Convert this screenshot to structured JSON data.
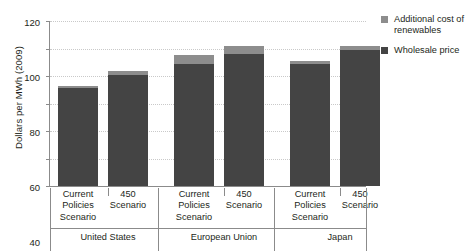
{
  "chart_data": {
    "type": "bar",
    "subtype": "stacked-bar-grouped",
    "title": "",
    "subtitle": "",
    "xlabel": "",
    "ylabel": "Dollars per MWh (2009)",
    "ylim": [
      0,
      120
    ],
    "yticks": [
      0,
      20,
      40,
      60,
      80,
      100,
      120
    ],
    "ytick_labels": [
      "0",
      "20",
      "40",
      "60",
      "80",
      "100",
      "120"
    ],
    "grid": "horizontal-dotted",
    "legend_position": "right-top",
    "groups": [
      "United States",
      "European Union",
      "Japan"
    ],
    "categories": [
      "Current Policies Scenario",
      "450 Scenario",
      "Current Policies Scenario",
      "450 Scenario",
      "Current Policies Scenario",
      "450 Scenario"
    ],
    "series": [
      {
        "name": "Wholesale price",
        "color": "#444444",
        "values": [
          71,
          81,
          89,
          96,
          89,
          99
        ]
      },
      {
        "name": "Additional cost of renewables",
        "color": "#8d8d8d",
        "values": [
          2,
          3,
          6,
          6,
          2,
          3
        ]
      }
    ],
    "totals": [
      73,
      84,
      95,
      102,
      91,
      102
    ]
  },
  "axis": {
    "y_title": "Dollars per MWh (2009)",
    "y_ticks": [
      {
        "value": 120,
        "label": "120"
      },
      {
        "value": 100,
        "label": "100"
      },
      {
        "value": 80,
        "label": "80"
      },
      {
        "value": 60,
        "label": "60"
      },
      {
        "value": 40,
        "label": "40"
      },
      {
        "value": 20,
        "label": "20"
      },
      {
        "value": 0,
        "label": "0"
      }
    ]
  },
  "bars": [
    {
      "id": "us-cps",
      "scenario_line1": "Current",
      "scenario_line2": "Policies",
      "scenario_line3": "Scenario",
      "wholesale": 71,
      "renewables": 2
    },
    {
      "id": "us-450",
      "scenario_line1": "450",
      "scenario_line2": "Scenario",
      "scenario_line3": "",
      "wholesale": 81,
      "renewables": 3
    },
    {
      "id": "eu-cps",
      "scenario_line1": "Current",
      "scenario_line2": "Policies",
      "scenario_line3": "Scenario",
      "wholesale": 89,
      "renewables": 6
    },
    {
      "id": "eu-450",
      "scenario_line1": "450",
      "scenario_line2": "Scenario",
      "scenario_line3": "",
      "wholesale": 96,
      "renewables": 6
    },
    {
      "id": "jp-cps",
      "scenario_line1": "Current",
      "scenario_line2": "Policies",
      "scenario_line3": "Scenario",
      "wholesale": 89,
      "renewables": 2
    },
    {
      "id": "jp-450",
      "scenario_line1": "450",
      "scenario_line2": "Scenario",
      "scenario_line3": "",
      "wholesale": 99,
      "renewables": 3
    }
  ],
  "groups": [
    {
      "id": "united-states",
      "label": "United States"
    },
    {
      "id": "european-union",
      "label": "European Union"
    },
    {
      "id": "japan",
      "label": "Japan"
    }
  ],
  "legend": {
    "items": [
      {
        "id": "additional-cost-of-renewables",
        "label_line1": "Additional cost of",
        "label_line2": "renewables",
        "color": "#8d8d8d"
      },
      {
        "id": "wholesale-price",
        "label_line1": "Wholesale price",
        "label_line2": "",
        "color": "#444444"
      }
    ]
  }
}
